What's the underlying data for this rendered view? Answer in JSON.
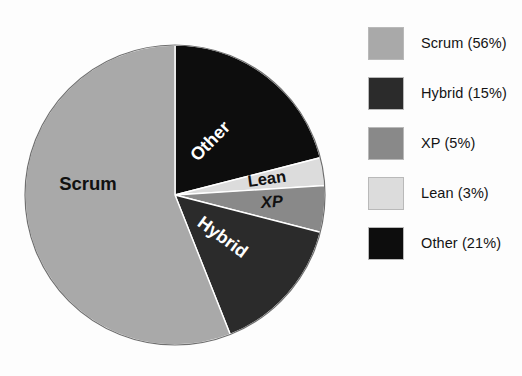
{
  "figure": {
    "type": "pie-chart-figure",
    "background_color": "#ffffff"
  },
  "chart_data": {
    "type": "pie",
    "title": "",
    "xlabel": "",
    "ylabel": "",
    "grid": false,
    "legend_position": "right",
    "unit": "percent",
    "start_angle_deg": 0,
    "direction": "clockwise",
    "categories": [
      "Scrum",
      "Hybrid",
      "XP",
      "Lean",
      "Other"
    ],
    "values": [
      56,
      15,
      5,
      3,
      21
    ],
    "slices": [
      {
        "name": "Scrum",
        "value": 56,
        "value_label": "56%",
        "legend_text": "Scrum (56%)",
        "color": "#a9a9a9",
        "slice_label": "Scrum",
        "slice_label_color": "#111111",
        "slice_label_rotation": 0
      },
      {
        "name": "Hybrid",
        "value": 15,
        "value_label": "15%",
        "legend_text": "Hybrid (15%)",
        "color": "#2b2b2b",
        "slice_label": "Hybrid",
        "slice_label_color": "#ffffff",
        "slice_label_rotation": 35
      },
      {
        "name": "XP",
        "value": 5,
        "value_label": "5%",
        "legend_text": "XP (5%)",
        "color": "#898989",
        "slice_label": "XP",
        "slice_label_color": "#111111",
        "slice_label_rotation": 0
      },
      {
        "name": "Lean",
        "value": 3,
        "value_label": "3%",
        "legend_text": "Lean (3%)",
        "color": "#dcdcdc",
        "slice_label": "Lean",
        "slice_label_color": "#111111",
        "slice_label_rotation": -8
      },
      {
        "name": "Other",
        "value": 21,
        "value_label": "21%",
        "legend_text": "Other (21%)",
        "color": "#0d0d0d",
        "slice_label": "Other",
        "slice_label_color": "#ffffff",
        "slice_label_rotation": -45
      }
    ]
  },
  "pie": {
    "center_x": 175,
    "center_y": 195,
    "radius": 150,
    "labels": {
      "scrum": "Scrum",
      "other": "Other",
      "lean": "Lean",
      "xp": "XP",
      "hybrid": "Hybrid"
    }
  },
  "legend": {
    "items": [
      {
        "label": "Scrum (56%)",
        "color": "#a9a9a9"
      },
      {
        "label": "Hybrid (15%)",
        "color": "#2b2b2b"
      },
      {
        "label": "XP (5%)",
        "color": "#898989"
      },
      {
        "label": "Lean (3%)",
        "color": "#dcdcdc"
      },
      {
        "label": "Other (21%)",
        "color": "#0d0d0d"
      }
    ]
  }
}
